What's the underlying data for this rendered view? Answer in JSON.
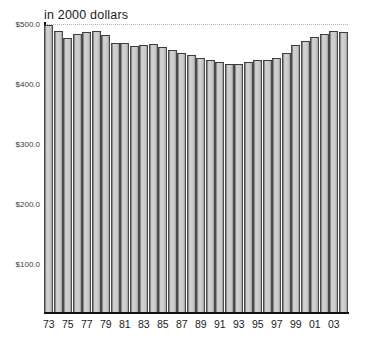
{
  "chart_data": {
    "type": "bar",
    "title": "in 2000 dollars",
    "xlabel": "",
    "ylabel": "",
    "ylim": [
      20,
      500
    ],
    "grid": "top-dotted-only",
    "legend": "none",
    "y_tick_labels": [
      "$500.0",
      "$400.0",
      "$300.0",
      "$200.0",
      "$100.0"
    ],
    "y_tick_values": [
      500,
      400,
      300,
      200,
      100
    ],
    "x_tick_labels": [
      "73",
      "75",
      "77",
      "79",
      "81",
      "83",
      "85",
      "87",
      "89",
      "91",
      "93",
      "95",
      "97",
      "99",
      "01",
      "03"
    ],
    "categories": [
      "73",
      "74",
      "75",
      "76",
      "77",
      "78",
      "79",
      "80",
      "81",
      "82",
      "83",
      "84",
      "85",
      "86",
      "87",
      "88",
      "89",
      "90",
      "91",
      "92",
      "93",
      "94",
      "95",
      "96",
      "97",
      "98",
      "99",
      "00",
      "01",
      "02",
      "03",
      "04"
    ],
    "values": [
      499,
      489,
      477,
      484,
      486,
      488,
      482,
      468,
      468,
      463,
      465,
      466,
      461,
      457,
      452,
      448,
      444,
      440,
      436,
      434,
      434,
      436,
      440,
      440,
      443,
      452,
      465,
      471,
      478,
      484,
      489,
      487
    ],
    "bar_color": "#cccccc",
    "bar_edge_color": "#444444"
  },
  "axes": {
    "title": "in 2000 dollars"
  }
}
